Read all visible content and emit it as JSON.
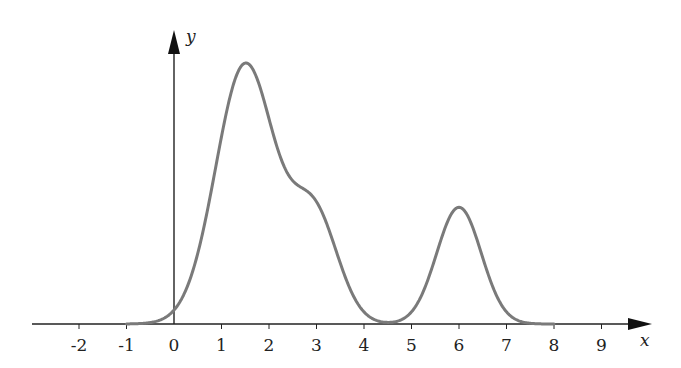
{
  "chart_data": {
    "type": "line",
    "title": "",
    "xlabel": "x",
    "ylabel": "y",
    "xlim": [
      -3,
      9.8
    ],
    "x_ticks": [
      -2,
      -1,
      0,
      1,
      2,
      3,
      4,
      5,
      6,
      7,
      8,
      9
    ],
    "x_tick_labels": [
      "-2",
      "-1",
      "0",
      "1",
      "2",
      "3",
      "4",
      "5",
      "6",
      "7",
      "8",
      "9"
    ],
    "y_ticks": [],
    "grid": false,
    "legend": null,
    "series": [
      {
        "name": "f(x)",
        "color": "#7a7a7a",
        "description": "Bimodal curve: tall peak near x=1.5 with a shoulder near x=3, dips to ~0 near x=4.5, second smaller peak at x=6, ~0 outside [-0.5, 7.5]",
        "components": [
          {
            "center": 1.5,
            "sigma": 0.62,
            "amplitude": 1.0
          },
          {
            "center": 2.95,
            "sigma": 0.5,
            "amplitude": 0.42
          },
          {
            "center": 6.0,
            "sigma": 0.47,
            "amplitude": 0.45
          }
        ],
        "key_points": [
          {
            "x": -1,
            "y": 0.0
          },
          {
            "x": 0,
            "y": 0.05
          },
          {
            "x": 1.5,
            "y": 1.0
          },
          {
            "x": 3.0,
            "y": 0.53
          },
          {
            "x": 4.5,
            "y": 0.0
          },
          {
            "x": 6.0,
            "y": 0.45
          },
          {
            "x": 7.5,
            "y": 0.0
          }
        ]
      }
    ]
  },
  "layout": {
    "origin_px": [
      174,
      324
    ],
    "unit_px": 47.5,
    "y_unit_px": 261,
    "x_axis_start_px": 32,
    "x_axis_end_px": 652,
    "y_axis_top_px": 30,
    "axis_color": "#222222",
    "curve_color": "#7a7a7a"
  }
}
